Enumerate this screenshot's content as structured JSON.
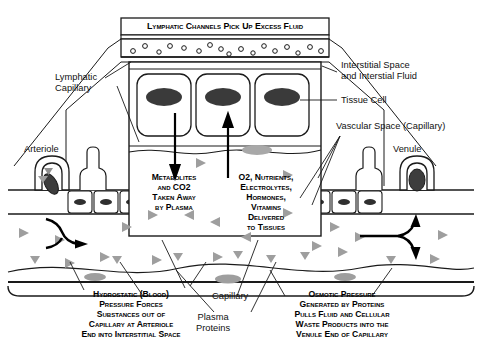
{
  "diagram": {
    "title_banner": "Lymphatic Channels Pick Up Excess Fluid",
    "center_left_caption": "Metabolites\nand CO2\nTaken Away\nby Plasma",
    "center_right_caption": "O2, Nutrients,\nElectrolytes,\nHormones,\nVitamins\nDelivered\nto Tissues",
    "bottom_left_caption": "Hydrostatic (Blood)\nPressure Forces\nSubstances out of\nCapillary at Arteriole\nEnd into Interstitial Space",
    "bottom_right_caption": "Osmotic Pressure\nGenerated by Proteins\nPulls Fluid and Cellular\nWaste Products into the\nVenule End of Capillary",
    "labels": {
      "lymphatic_capillary": "Lymphatic\nCapillary",
      "arteriole": "Arteriole",
      "venule": "Venule",
      "interstitial_space": "Interstitial Space\nand Interstial Fluid",
      "tissue_cell": "Tissue Cell",
      "vascular_space": "Vascular Space (Capillary)",
      "capillary": "Capillary",
      "plasma_proteins": "Plasma\nProteins"
    },
    "colors": {
      "stroke": "#1a1a1a",
      "nucleus_dark": "#3a3a3a",
      "nucleus_gray": "#9a9a9a",
      "protein_gray": "#9e9e9e",
      "background": "#ffffff"
    }
  }
}
